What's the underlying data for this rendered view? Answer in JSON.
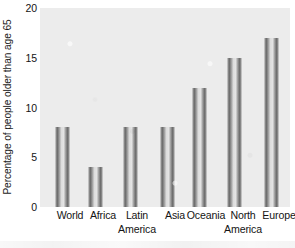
{
  "chart_data": {
    "type": "bar",
    "title": "",
    "xlabel": "",
    "ylabel": "Percentage of people older than age 65",
    "categories": [
      "World",
      "Africa",
      "Latin America",
      "Asia",
      "Oceania",
      "North America",
      "Europe"
    ],
    "category_lines": [
      [
        "World",
        ""
      ],
      [
        "Africa",
        ""
      ],
      [
        "Latin",
        "America"
      ],
      [
        "Asia",
        ""
      ],
      [
        "Oceania",
        ""
      ],
      [
        "North",
        "America"
      ],
      [
        "Europe",
        ""
      ]
    ],
    "values": [
      8,
      4,
      8,
      8,
      12,
      15,
      17
    ],
    "ylim": [
      0,
      20
    ],
    "yticks": [
      0,
      5,
      10,
      15,
      20
    ],
    "ytick_labels": [
      "0",
      "5",
      "10",
      "15",
      "20"
    ],
    "grid": false,
    "legend": null,
    "bar_style": "outlined",
    "colors": {
      "bar_edge": "#6e6e6e",
      "bar_fill": "#e4e4e4",
      "panel_background": "#ececec",
      "figure_background": "#ffffff",
      "text": "#141414"
    }
  }
}
